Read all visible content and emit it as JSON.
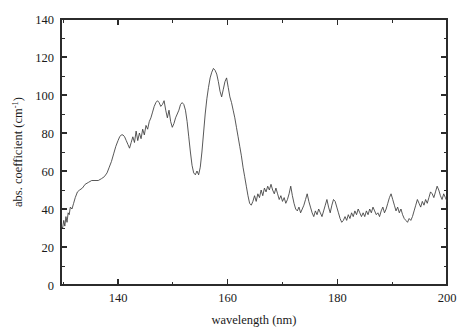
{
  "chart_data": {
    "type": "line",
    "title": "",
    "subtitle": "",
    "xlabel": "wavelength (nm)",
    "ylabel_main": "abs. coefficient (cm",
    "ylabel_sup": "-1",
    "ylabel_close": ")",
    "ylabel_full": "abs. coefficient (cm-1)",
    "xlim": [
      129.6,
      200.0
    ],
    "ylim": [
      0,
      140
    ],
    "x_major_ticks": [
      140,
      160,
      180,
      200
    ],
    "x_major_ticklabels": [
      "140",
      "160",
      "180",
      "200"
    ],
    "x_minor_ticks": [
      130,
      150,
      170,
      190
    ],
    "y_major_ticks": [
      0,
      20,
      40,
      60,
      80,
      100,
      120,
      140
    ],
    "y_major_ticklabels": [
      "0",
      "20",
      "40",
      "60",
      "80",
      "100",
      "120",
      "140"
    ],
    "y_minor_ticks": [
      10,
      30,
      50,
      70,
      90,
      110,
      130
    ],
    "grid": false,
    "legend": null,
    "legend_position": "none",
    "series": [
      {
        "name": "absorption coefficient",
        "color": "#3a3a3a",
        "x": [
          129.6,
          129.9,
          130.1,
          130.3,
          130.5,
          130.7,
          130.9,
          131.1,
          131.3,
          131.6,
          131.9,
          132.2,
          132.6,
          133.0,
          133.5,
          134.0,
          134.6,
          135.2,
          135.8,
          136.4,
          137.0,
          137.5,
          138.0,
          138.4,
          138.8,
          139.2,
          139.6,
          140.0,
          140.3,
          140.6,
          140.9,
          141.2,
          141.5,
          141.8,
          142.1,
          142.4,
          142.7,
          143.0,
          143.3,
          143.6,
          143.9,
          144.2,
          144.5,
          144.8,
          145.1,
          145.4,
          145.7,
          146.0,
          146.3,
          146.6,
          146.9,
          147.2,
          147.5,
          147.8,
          148.1,
          148.4,
          148.7,
          149.0,
          149.3,
          149.6,
          149.9,
          150.2,
          150.5,
          150.8,
          151.1,
          151.4,
          151.7,
          152.0,
          152.3,
          152.6,
          152.9,
          153.2,
          153.5,
          153.8,
          154.1,
          154.4,
          154.7,
          155.0,
          155.3,
          155.6,
          155.9,
          156.2,
          156.5,
          156.8,
          157.1,
          157.4,
          157.7,
          158.0,
          158.3,
          158.6,
          158.9,
          159.2,
          159.5,
          159.8,
          160.1,
          160.4,
          160.7,
          161.0,
          161.3,
          161.6,
          161.9,
          162.2,
          162.5,
          162.8,
          163.1,
          163.4,
          163.7,
          164.0,
          164.3,
          164.6,
          164.9,
          165.2,
          165.5,
          165.8,
          166.1,
          166.4,
          166.7,
          167.0,
          167.3,
          167.6,
          167.9,
          168.2,
          168.5,
          168.8,
          169.1,
          169.4,
          169.7,
          170.0,
          170.3,
          170.6,
          170.9,
          171.2,
          171.5,
          171.8,
          172.1,
          172.4,
          172.7,
          173.0,
          173.3,
          173.6,
          173.9,
          174.2,
          174.5,
          174.8,
          175.1,
          175.4,
          175.7,
          176.0,
          176.3,
          176.6,
          176.9,
          177.2,
          177.5,
          177.8,
          178.1,
          178.4,
          178.7,
          179.0,
          179.3,
          179.6,
          179.9,
          180.2,
          180.5,
          180.8,
          181.1,
          181.4,
          181.7,
          182.0,
          182.3,
          182.6,
          182.9,
          183.2,
          183.5,
          183.8,
          184.1,
          184.4,
          184.7,
          185.0,
          185.3,
          185.6,
          185.9,
          186.2,
          186.5,
          186.8,
          187.1,
          187.4,
          187.7,
          188.0,
          188.3,
          188.6,
          188.9,
          189.2,
          189.5,
          189.8,
          190.1,
          190.4,
          190.7,
          191.0,
          191.3,
          191.6,
          191.9,
          192.2,
          192.5,
          192.8,
          193.1,
          193.4,
          193.7,
          194.0,
          194.3,
          194.6,
          194.9,
          195.2,
          195.5,
          195.8,
          196.1,
          196.4,
          196.7,
          197.0,
          197.3,
          197.6,
          197.9,
          198.2,
          198.5,
          198.8,
          199.1,
          199.4,
          199.7,
          200.0
        ],
        "y": [
          31,
          30,
          34,
          31,
          36,
          33,
          38,
          37,
          41,
          40,
          43,
          46,
          49,
          50,
          51,
          53,
          54,
          55,
          55,
          55,
          56,
          57,
          59,
          62,
          65,
          69,
          73,
          76,
          78,
          79,
          79,
          78,
          76,
          74,
          72,
          75,
          78,
          75,
          81,
          76,
          80,
          77,
          82,
          79,
          84,
          82,
          86,
          88,
          91,
          94,
          96,
          97,
          96,
          94,
          95,
          97,
          92,
          88,
          92,
          86,
          83,
          85,
          88,
          90,
          92,
          95,
          96,
          95,
          92,
          86,
          78,
          70,
          63,
          59,
          58,
          60,
          58,
          62,
          70,
          80,
          90,
          98,
          104,
          109,
          112,
          114,
          113,
          111,
          107,
          102,
          99,
          103,
          107,
          109,
          104,
          99,
          96,
          92,
          88,
          83,
          78,
          73,
          68,
          62,
          57,
          52,
          47,
          43,
          42,
          44,
          47,
          44,
          48,
          46,
          50,
          47,
          51,
          49,
          52,
          50,
          53,
          50,
          48,
          51,
          48,
          45,
          47,
          44,
          46,
          43,
          45,
          48,
          52,
          47,
          43,
          40,
          39,
          41,
          38,
          40,
          42,
          45,
          48,
          44,
          41,
          38,
          36,
          39,
          37,
          40,
          38,
          36,
          39,
          42,
          45,
          41,
          38,
          42,
          45,
          44,
          41,
          38,
          35,
          33,
          34,
          36,
          34,
          37,
          35,
          38,
          36,
          39,
          37,
          40,
          38,
          36,
          38,
          36,
          39,
          37,
          40,
          38,
          41,
          39,
          37,
          38,
          36,
          39,
          41,
          38,
          40,
          43,
          46,
          48,
          45,
          42,
          39,
          41,
          38,
          40,
          37,
          35,
          34,
          33,
          35,
          34,
          36,
          39,
          42,
          45,
          43,
          41,
          44,
          42,
          45,
          43,
          46,
          49,
          48,
          46,
          49,
          52,
          50,
          47,
          45,
          48,
          46,
          44
        ]
      }
    ]
  },
  "plot_geometry": {
    "left": 61,
    "right": 447,
    "top": 19,
    "bottom": 285
  }
}
